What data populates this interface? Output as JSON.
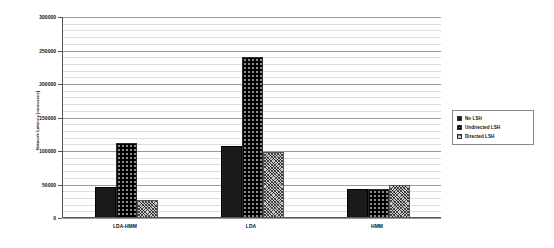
{
  "chart_data": {
    "type": "bar",
    "title": "",
    "xlabel": "",
    "ylabel": "Network Latency [nanosecs]",
    "categories": [
      "LDA-HMM",
      "LDA",
      "HMM"
    ],
    "series": [
      {
        "name": "No LSH",
        "pattern": "solid-black",
        "values": [
          47000,
          108000,
          43000
        ]
      },
      {
        "name": "Undirected LSH",
        "pattern": "basketweave",
        "values": [
          112000,
          240000,
          44000
        ]
      },
      {
        "name": "Directed LSH",
        "pattern": "crosshatch",
        "values": [
          27000,
          98000,
          50000
        ]
      }
    ],
    "ylim": [
      0,
      300000
    ],
    "ytick_step": 50000,
    "yticks": [
      0,
      50000,
      100000,
      150000,
      200000,
      250000,
      300000
    ],
    "ytick_labels": [
      "0",
      "50000",
      "100000",
      "150000",
      "200000",
      "250000",
      "300000"
    ],
    "minor_gridline_step": 10000,
    "grid": true,
    "legend_position": "right",
    "colors": {
      "series_no_lsh": "#1b1b1b",
      "series_undirected_lsh": "#8c8c8c",
      "series_directed_lsh": "#c9c9c9",
      "axis": "#555555",
      "grid_major": "#9a9a9a",
      "grid_minor": "#dcdcdc",
      "background": "#ffffff",
      "text": "#111111"
    }
  },
  "legend": {
    "items": [
      {
        "label": "No LSH"
      },
      {
        "label": "Undirected LSH"
      },
      {
        "label": "Directed LSH"
      }
    ]
  }
}
